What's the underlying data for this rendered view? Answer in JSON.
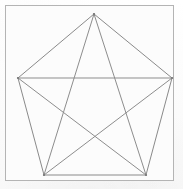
{
  "figure": {
    "caption": "",
    "canvas": {
      "width": 183,
      "height": 189,
      "background_color": "#fdfdfd"
    },
    "frame": {
      "name": "outer-border-rectangle",
      "x": 5,
      "y": 5,
      "width": 168,
      "height": 175,
      "stroke_color": "#b4b4b4",
      "stroke_width": 1,
      "fill_color": "#fcfcfc"
    },
    "style": {
      "edge_color": "#8a8a8a",
      "diagonal_color": "#8d8d8d",
      "line_width": 1,
      "vertex_marker_color": "#7a7a7a",
      "vertex_marker_radius": 1.1
    },
    "shape": {
      "type": "pentagon",
      "sides": 5,
      "regular": true,
      "vertex_labels": [
        "A",
        "B",
        "C",
        "D",
        "E"
      ],
      "vertices": [
        {
          "label": "A",
          "name": "vertex-top",
          "x": 94,
          "y": 14
        },
        {
          "label": "B",
          "name": "vertex-right",
          "x": 172,
          "y": 78
        },
        {
          "label": "C",
          "name": "vertex-bottom-right",
          "x": 146,
          "y": 175
        },
        {
          "label": "D",
          "name": "vertex-bottom-left",
          "x": 44,
          "y": 175
        },
        {
          "label": "E",
          "name": "vertex-left",
          "x": 18,
          "y": 78
        }
      ],
      "edges": [
        {
          "name": "edge-A-B",
          "from": "A",
          "to": "B"
        },
        {
          "name": "edge-B-C",
          "from": "B",
          "to": "C"
        },
        {
          "name": "edge-C-D",
          "from": "C",
          "to": "D"
        },
        {
          "name": "edge-D-E",
          "from": "D",
          "to": "E"
        },
        {
          "name": "edge-E-A",
          "from": "E",
          "to": "A"
        }
      ],
      "diagonals": [
        {
          "name": "diagonal-A-C",
          "from": "A",
          "to": "C"
        },
        {
          "name": "diagonal-A-D",
          "from": "A",
          "to": "D"
        },
        {
          "name": "diagonal-B-D",
          "from": "B",
          "to": "D"
        },
        {
          "name": "diagonal-B-E",
          "from": "B",
          "to": "E"
        },
        {
          "name": "diagonal-C-E",
          "from": "C",
          "to": "E"
        }
      ],
      "diagonal_count": 5
    }
  }
}
